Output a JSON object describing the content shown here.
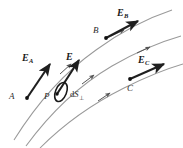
{
  "figure": {
    "background_color": "#ffffff",
    "ink_color": "#1a1a1a",
    "fieldline_color": "#8c8c8c",
    "vector_color": "#1f1f1f"
  },
  "labels": {
    "E_A": {
      "symbol": "E",
      "subscript": "A"
    },
    "E_B": {
      "symbol": "E",
      "subscript": "B"
    },
    "E_C": {
      "symbol": "E",
      "subscript": "C"
    },
    "E": {
      "symbol": "E",
      "subscript": ""
    },
    "point_A": "A",
    "point_B": "B",
    "point_C": "C",
    "point_P": "P",
    "area_element": {
      "prefix": "d",
      "symbol": "S",
      "subscript": "⊥"
    }
  },
  "field_lines": [
    {
      "name": "field-line-upper",
      "path": "M 14 140 C 34 108, 62 74, 96 50 C 122 31, 148 18, 172 10",
      "arrow_markers": [
        {
          "x": 66,
          "y": 68,
          "angle": -39
        },
        {
          "x": 118,
          "y": 33,
          "angle": -25
        }
      ]
    },
    {
      "name": "field-line-middle",
      "path": "M 26 146 C 48 116, 78 86, 112 66 C 138 51, 160 42, 181 36",
      "arrow_markers": [
        {
          "x": 88,
          "y": 79,
          "angle": -34
        },
        {
          "x": 143,
          "y": 50,
          "angle": -20
        }
      ]
    },
    {
      "name": "field-line-lower",
      "path": "M 40 148 C 62 126, 92 104, 124 88 C 148 76, 166 69, 183 64",
      "arrow_markers": [
        {
          "x": 104,
          "y": 97,
          "angle": -29
        }
      ]
    }
  ],
  "vectors": [
    {
      "name": "vector-E-A",
      "x1": 27,
      "y1": 98,
      "x2": 52,
      "y2": 62,
      "label": "E_A"
    },
    {
      "name": "vector-E-P",
      "x1": 56,
      "y1": 94,
      "x2": 81,
      "y2": 58,
      "label": "E"
    },
    {
      "name": "vector-E-B",
      "x1": 106,
      "y1": 38,
      "x2": 140,
      "y2": 20,
      "label": "E_B"
    },
    {
      "name": "vector-E-C",
      "x1": 130,
      "y1": 79,
      "x2": 166,
      "y2": 63,
      "label": "E_C"
    }
  ],
  "points": [
    {
      "name": "point-marker-A",
      "x": 27,
      "y": 98
    },
    {
      "name": "point-marker-B",
      "x": 106,
      "y": 38
    },
    {
      "name": "point-marker-C",
      "x": 130,
      "y": 79
    },
    {
      "name": "point-marker-P",
      "x": 56,
      "y": 94
    }
  ],
  "area_element_ellipse": {
    "name": "area-element-ellipse",
    "cx": 61,
    "cy": 92,
    "rx": 5.5,
    "ry": 10,
    "rotation": 22
  },
  "label_positions": {
    "E_A": {
      "left": 22,
      "top": 53
    },
    "E": {
      "left": 66,
      "top": 52
    },
    "E_B": {
      "left": 117,
      "top": 8
    },
    "E_C": {
      "left": 138,
      "top": 55
    },
    "point_A": {
      "left": 9,
      "top": 92
    },
    "point_B": {
      "left": 93,
      "top": 26
    },
    "point_C": {
      "left": 127,
      "top": 84
    },
    "point_P": {
      "left": 44,
      "top": 92
    },
    "area_element": {
      "left": 70,
      "top": 90
    }
  }
}
